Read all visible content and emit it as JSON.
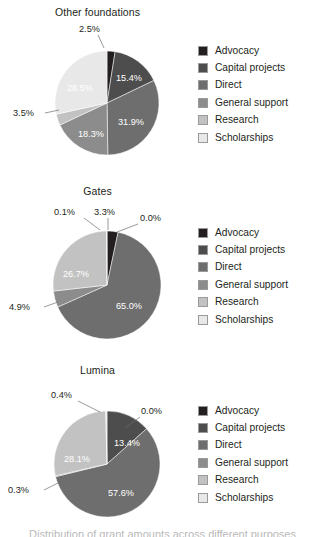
{
  "chart_data": [
    {
      "type": "pie",
      "title": "Other foundations",
      "categories": [
        "Advocacy",
        "Capital projects",
        "Direct",
        "General support",
        "Research",
        "Scholarships"
      ],
      "values": [
        2.5,
        15.4,
        31.9,
        18.3,
        3.5,
        28.5
      ],
      "labels": [
        "2.5%",
        "15.4%",
        "31.9%",
        "18.3%",
        "3.5%",
        "28.5%"
      ],
      "units": "percent",
      "legend_position": "right",
      "start_angle": 0,
      "direction": "clockwise"
    },
    {
      "type": "pie",
      "title": "Gates",
      "categories": [
        "Advocacy",
        "Capital projects",
        "Direct",
        "General support",
        "Research",
        "Scholarships"
      ],
      "values": [
        3.3,
        0.0,
        65.0,
        4.9,
        26.7,
        0.1
      ],
      "labels": [
        "3.3%",
        "0.0%",
        "65.0%",
        "4.9%",
        "26.7%",
        "0.1%"
      ],
      "units": "percent",
      "legend_position": "right",
      "start_angle": 0,
      "direction": "clockwise"
    },
    {
      "type": "pie",
      "title": "Lumina",
      "categories": [
        "Advocacy",
        "Capital projects",
        "Direct",
        "General support",
        "Research",
        "Scholarships"
      ],
      "values": [
        0.0,
        13.4,
        57.6,
        0.3,
        28.1,
        0.4
      ],
      "labels": [
        "0.0%",
        "13.4%",
        "57.6%",
        "0.3%",
        "28.1%",
        "0.4%"
      ],
      "units": "percent",
      "legend_position": "right",
      "start_angle": 0,
      "direction": "clockwise"
    }
  ],
  "palette": {
    "advocacy": "#231f20",
    "capital_projects": "#4d4d4d",
    "direct": "#6e6e6e",
    "general_support": "#8c8c8c",
    "research": "#c2c2c2",
    "scholarships": "#e8e8e8",
    "background": "#ffffff",
    "text": "#231f20",
    "leader_line": "#6d6d6d"
  },
  "charts": [
    {
      "title": "Other foundations",
      "legend": [
        {
          "label": "Advocacy",
          "color": "#231f20"
        },
        {
          "label": "Capital projects",
          "color": "#4d4d4d"
        },
        {
          "label": "Direct",
          "color": "#6e6e6e"
        },
        {
          "label": "General support",
          "color": "#8c8c8c"
        },
        {
          "label": "Research",
          "color": "#c2c2c2"
        },
        {
          "label": "Scholarships",
          "color": "#e8e8e8"
        }
      ],
      "slice_labels": {
        "advocacy": "2.5%",
        "capital_projects": "15.4%",
        "direct": "31.9%",
        "general_support": "18.3%",
        "research": "3.5%",
        "scholarships": "28.5%"
      }
    },
    {
      "title": "Gates",
      "legend": [
        {
          "label": "Advocacy",
          "color": "#231f20"
        },
        {
          "label": "Capital projects",
          "color": "#4d4d4d"
        },
        {
          "label": "Direct",
          "color": "#6e6e6e"
        },
        {
          "label": "General support",
          "color": "#8c8c8c"
        },
        {
          "label": "Research",
          "color": "#c2c2c2"
        },
        {
          "label": "Scholarships",
          "color": "#e8e8e8"
        }
      ],
      "slice_labels": {
        "advocacy": "3.3%",
        "capital_projects": "0.0%",
        "direct": "65.0%",
        "general_support": "4.9%",
        "research": "26.7%",
        "scholarships": "0.1%"
      }
    },
    {
      "title": "Lumina",
      "legend": [
        {
          "label": "Advocacy",
          "color": "#231f20"
        },
        {
          "label": "Capital projects",
          "color": "#4d4d4d"
        },
        {
          "label": "Direct",
          "color": "#6e6e6e"
        },
        {
          "label": "General support",
          "color": "#8c8c8c"
        },
        {
          "label": "Research",
          "color": "#c2c2c2"
        },
        {
          "label": "Scholarships",
          "color": "#e8e8e8"
        }
      ],
      "slice_labels": {
        "advocacy": "0.0%",
        "capital_projects": "13.4%",
        "direct": "57.6%",
        "general_support": "0.3%",
        "research": "28.1%",
        "scholarships": "0.4%"
      }
    }
  ],
  "footer": {
    "text": "Distribution of grant amounts across different purposes"
  }
}
